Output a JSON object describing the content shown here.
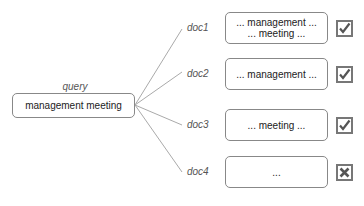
{
  "query": {
    "label": "query",
    "text": "management meeting"
  },
  "documents": [
    {
      "id": "doc1",
      "line1": "... management ...",
      "line2": "... meeting ...",
      "relevant": true,
      "icon": "checkbox-checked-icon"
    },
    {
      "id": "doc2",
      "line1": "... management ...",
      "line2": "",
      "relevant": true,
      "icon": "checkbox-checked-icon"
    },
    {
      "id": "doc3",
      "line1": "... meeting ...",
      "line2": "",
      "relevant": true,
      "icon": "checkbox-checked-icon"
    },
    {
      "id": "doc4",
      "line1": "...",
      "line2": "",
      "relevant": false,
      "icon": "checkbox-x-icon"
    }
  ],
  "colors": {
    "line": "#aaaaaa",
    "box_border": "#888888",
    "checkbox_border": "#777777"
  }
}
